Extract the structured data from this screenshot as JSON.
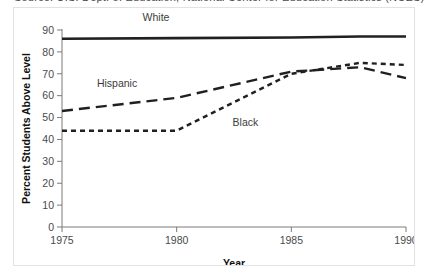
{
  "caption": {
    "text": "Source: U.S. Dept. of Education, National Center for Education Statistics (NCES)"
  },
  "chart_data": {
    "type": "line",
    "title": "",
    "xlabel": "Year",
    "ylabel": "Percent Students Above Level",
    "xlim": [
      1975,
      1990
    ],
    "ylim": [
      0,
      90
    ],
    "xticks": [
      1975,
      1980,
      1985,
      1990
    ],
    "yticks": [
      0,
      10,
      20,
      30,
      40,
      50,
      60,
      70,
      80,
      90
    ],
    "grid": false,
    "legend": "inline-labels",
    "series": [
      {
        "name": "White",
        "label": "White",
        "style": "solid",
        "color": "#231f20",
        "width": 2.6,
        "label_x": 1979.1,
        "label_y": 94,
        "x": [
          1975,
          1980,
          1985,
          1988,
          1990
        ],
        "y": [
          86,
          86.3,
          86.6,
          87,
          87
        ]
      },
      {
        "name": "Hispanic",
        "label": "Hispanic",
        "style": "long-dash",
        "color": "#231f20",
        "width": 2.4,
        "label_x": 1977.4,
        "label_y": 64,
        "x": [
          1975,
          1980,
          1985,
          1988,
          1990
        ],
        "y": [
          53,
          59,
          71,
          73,
          68
        ]
      },
      {
        "name": "Black",
        "label": "Black",
        "style": "short-dash",
        "color": "#231f20",
        "width": 2.4,
        "label_x": 1983.0,
        "label_y": 46,
        "x": [
          1975,
          1980,
          1985,
          1988,
          1990
        ],
        "y": [
          44,
          44,
          70,
          75,
          74
        ]
      }
    ]
  }
}
